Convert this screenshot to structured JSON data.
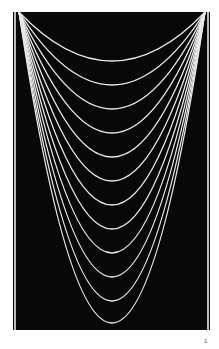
{
  "figure": {
    "background_color": "#080808",
    "curve_color": "#e8e8e8",
    "curve_count": 12,
    "apex_left": {
      "x": 6,
      "y": 0
    },
    "apex_right": {
      "x": 192,
      "y": 0
    },
    "curve_minima_y": [
      49,
      73,
      97,
      121,
      145,
      169,
      193,
      217,
      241,
      265,
      289,
      311
    ]
  },
  "page": {
    "number": "1"
  }
}
